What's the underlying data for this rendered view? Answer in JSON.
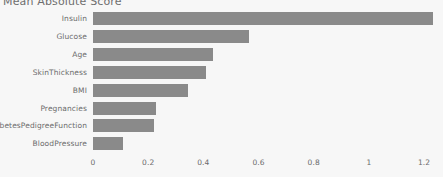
{
  "chart_data": {
    "type": "bar",
    "orientation": "horizontal",
    "title": "Mean Absolute Score",
    "xlabel": "",
    "ylabel": "",
    "categories": [
      "Insulin",
      "Glucose",
      "Age",
      "SkinThickness",
      "BMI",
      "Pregnancies",
      "DiabetesPedigreeFunction",
      "BloodPressure"
    ],
    "values": [
      1.233,
      0.565,
      0.435,
      0.41,
      0.344,
      0.228,
      0.221,
      0.109
    ],
    "xlim": [
      0,
      1.265
    ],
    "xticks": [
      0,
      0.2,
      0.4,
      0.6,
      0.8,
      1,
      1.2
    ],
    "xtick_labels": [
      "0",
      "0.2",
      "0.4",
      "0.6",
      "0.8",
      "1",
      "1.2"
    ],
    "grid": false,
    "legend": null,
    "bar_color": "#8a8a8a",
    "background_color": "#f7f7f7",
    "text_color": "#6b6b6b"
  }
}
